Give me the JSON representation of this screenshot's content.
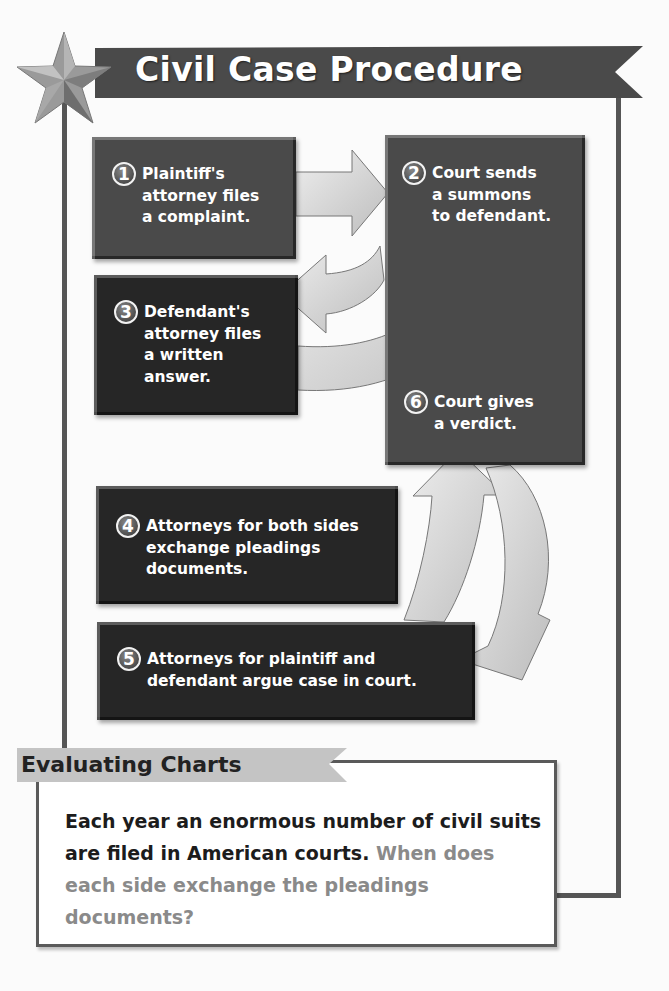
{
  "title": "Civil Case Procedure",
  "steps": [
    {
      "number": "1",
      "text": "Plaintiff's\nattorney files\na complaint."
    },
    {
      "number": "2",
      "text": "Court sends\na summons\nto defendant."
    },
    {
      "number": "3",
      "text": "Defendant's\nattorney files\na written\nanswer."
    },
    {
      "number": "4",
      "text": "Attorneys for both sides\nexchange pleadings\ndocuments."
    },
    {
      "number": "5",
      "text": "Attorneys for plaintiff and\ndefendant argue case in court."
    },
    {
      "number": "6",
      "text": "Court gives\na verdict."
    }
  ],
  "evaluating": {
    "heading": "Evaluating Charts",
    "statement": "Each year an enormous number of civil suits are filed in American courts.",
    "question": "When does each side exchange the pleadings documents?"
  },
  "colors": {
    "banner": "#4a4a4a",
    "box_mid": "#4a4a4a",
    "box_dark": "#262626",
    "arrow": "#d8d8d8",
    "question_text": "#8a8a8a"
  }
}
